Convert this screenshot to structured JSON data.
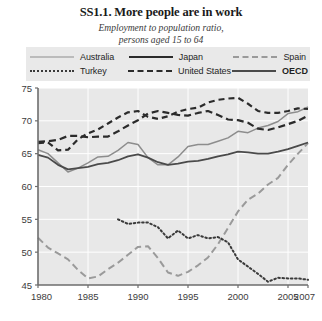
{
  "figure": {
    "title": "SS1.1.  More people are in work",
    "subtitle_line1": "Employment to population ratio,",
    "subtitle_line2": "persons aged 15 to 64"
  },
  "legend": {
    "rows": [
      [
        {
          "label": "Australia",
          "style": "solid-thin-grey",
          "swatch": "sw-australia"
        },
        {
          "label": "Japan",
          "style": "solid-thick-dark",
          "swatch": "sw-japan"
        },
        {
          "label": "Spain",
          "style": "dashed-grey",
          "swatch": "sw-spain"
        }
      ],
      [
        {
          "label": "Turkey",
          "style": "dotted-dark",
          "swatch": "sw-turkey"
        },
        {
          "label": "United States",
          "style": "dashed-dark",
          "swatch": "sw-us"
        },
        {
          "label": "OECD",
          "style": "solid-medium-dark",
          "swatch": "sw-oecd",
          "bold": true
        }
      ]
    ]
  },
  "chart_data": {
    "type": "line",
    "title": "SS1.1.  More people are in work",
    "subtitle": "Employment to population ratio, persons aged 15 to 64",
    "xlabel": "",
    "ylabel": "",
    "xlim": [
      1980,
      2007
    ],
    "ylim": [
      45,
      75
    ],
    "yticks": [
      45,
      50,
      55,
      60,
      65,
      70,
      75
    ],
    "xticks": [
      1980,
      1985,
      1990,
      1995,
      2000,
      2005,
      2007
    ],
    "xtick_labels": [
      "1980",
      "1985",
      "1990",
      "1995",
      "2000",
      "2005",
      "2007"
    ],
    "grid": true,
    "grid_color": "#ffffff",
    "plot_background": "#e8e8e8",
    "legend_position": "above-plot",
    "x": [
      1980,
      1981,
      1982,
      1983,
      1984,
      1985,
      1986,
      1987,
      1988,
      1989,
      1990,
      1991,
      1992,
      1993,
      1994,
      1995,
      1996,
      1997,
      1998,
      1999,
      2000,
      2001,
      2002,
      2003,
      2004,
      2005,
      2006,
      2007
    ],
    "series": [
      {
        "name": "Australia",
        "color": "#8d8d8d",
        "dash": "none",
        "width": 1.5,
        "values": [
          65.6,
          65.0,
          63.6,
          62.2,
          62.8,
          63.6,
          64.5,
          64.6,
          65.5,
          66.7,
          66.4,
          64.4,
          63.3,
          63.3,
          64.5,
          66.1,
          66.4,
          66.4,
          66.9,
          67.4,
          68.4,
          68.2,
          68.9,
          69.3,
          69.9,
          71.1,
          71.4,
          72.1
        ]
      },
      {
        "name": "Japan",
        "color": "#2b2b2b",
        "dash": "long",
        "width": 2.2,
        "values": [
          66.8,
          66.9,
          67.1,
          67.7,
          67.7,
          67.5,
          67.6,
          67.6,
          68.4,
          69.3,
          70.1,
          71.1,
          71.5,
          71.2,
          70.9,
          70.8,
          71.2,
          71.5,
          70.9,
          70.2,
          70.1,
          69.7,
          68.8,
          68.6,
          69.0,
          69.5,
          70.0,
          70.8
        ]
      },
      {
        "name": "Spain",
        "color": "#9a9a9a",
        "dash": "long",
        "width": 2.0,
        "values": [
          52.2,
          50.7,
          49.8,
          48.9,
          47.3,
          46.0,
          46.3,
          47.4,
          48.4,
          49.6,
          50.8,
          50.9,
          49.1,
          46.9,
          46.4,
          47.0,
          48.0,
          49.2,
          51.2,
          53.7,
          56.2,
          58.0,
          58.9,
          60.3,
          61.3,
          63.3,
          65.0,
          66.6
        ]
      },
      {
        "name": "Turkey",
        "color": "#3a3a3a",
        "dash": "dot",
        "width": 2.0,
        "start_year": 1988,
        "values": [
          null,
          null,
          null,
          null,
          null,
          null,
          null,
          null,
          55.0,
          54.3,
          54.5,
          54.5,
          53.8,
          52.1,
          53.3,
          52.1,
          52.6,
          52.1,
          52.3,
          51.5,
          48.9,
          47.8,
          46.7,
          45.5,
          46.1,
          46.0,
          46.0,
          45.8
        ]
      },
      {
        "name": "United States",
        "color": "#2b2b2b",
        "dash": "medium",
        "width": 2.2,
        "values": [
          66.6,
          66.7,
          65.5,
          65.6,
          67.2,
          68.1,
          68.7,
          69.6,
          70.5,
          71.3,
          71.5,
          70.6,
          70.3,
          70.7,
          71.4,
          71.8,
          72.0,
          72.8,
          73.2,
          73.4,
          73.5,
          72.6,
          71.5,
          71.2,
          71.2,
          71.5,
          71.9,
          71.8
        ]
      },
      {
        "name": "OECD",
        "color": "#4a4a4a",
        "dash": "none",
        "width": 1.8,
        "values": [
          64.8,
          64.4,
          63.3,
          62.6,
          62.8,
          63.0,
          63.4,
          63.6,
          64.0,
          64.6,
          64.9,
          64.4,
          63.7,
          63.3,
          63.5,
          63.8,
          63.9,
          64.2,
          64.6,
          64.9,
          65.3,
          65.2,
          65.0,
          65.0,
          65.3,
          65.7,
          66.2,
          66.7
        ]
      }
    ]
  }
}
